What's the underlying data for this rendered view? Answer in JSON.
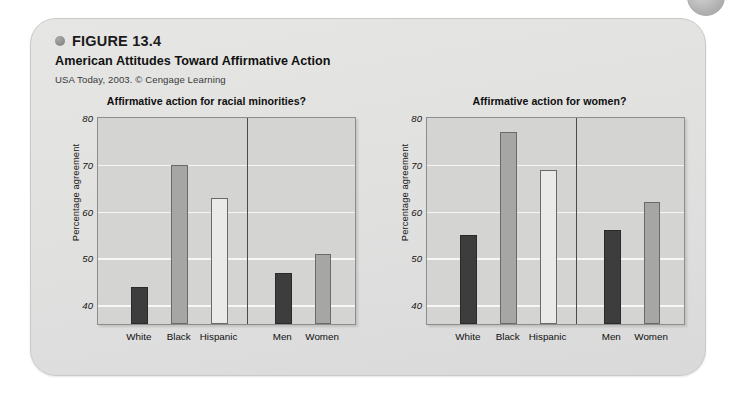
{
  "figure": {
    "number": "FIGURE 13.4",
    "title": "American Attitudes Toward Affirmative Action",
    "source": "USA Today, 2003. © Cengage Learning"
  },
  "colors": {
    "bar_dark": "#3d3d3d",
    "bar_mid": "#a6a6a4",
    "bar_light": "#eaeae8",
    "plot_background": "#d4d4d2",
    "gridline": "#f6f6f4",
    "card_background": "#e2e2e0"
  },
  "chart_data": [
    {
      "type": "bar",
      "title": "Affirmative action for racial minorities?",
      "xlabel": "",
      "ylabel": "Percentage agreement",
      "ylim": [
        36,
        80
      ],
      "yticks": [
        80,
        70,
        60,
        50,
        40
      ],
      "grid": true,
      "legend": "none",
      "groups": [
        "race",
        "gender"
      ],
      "categories": [
        "White",
        "Black",
        "Hispanic",
        "Men",
        "Women"
      ],
      "values": [
        44,
        70,
        63,
        47,
        51
      ],
      "bar_styles": [
        "dark",
        "mid",
        "light",
        "dark",
        "mid"
      ]
    },
    {
      "type": "bar",
      "title": "Affirmative action for women?",
      "xlabel": "",
      "ylabel": "Percentage agreement",
      "ylim": [
        36,
        80
      ],
      "yticks": [
        80,
        70,
        60,
        50,
        40
      ],
      "grid": true,
      "legend": "none",
      "groups": [
        "race",
        "gender"
      ],
      "categories": [
        "White",
        "Black",
        "Hispanic",
        "Men",
        "Women"
      ],
      "values": [
        55,
        77,
        69,
        56,
        62
      ],
      "bar_styles": [
        "dark",
        "mid",
        "light",
        "dark",
        "mid"
      ]
    }
  ]
}
